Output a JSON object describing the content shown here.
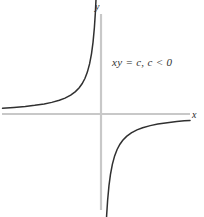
{
  "figure": {
    "title": "",
    "background_color": "#ffffff",
    "width": 204,
    "height": 217
  },
  "axes": {
    "x_label": "x",
    "y_label": "y",
    "axis_color": "#c8c8c8",
    "x_axis": {
      "y_pixel": 114,
      "x_start": 2,
      "x_end": 190
    },
    "y_axis": {
      "x_pixel": 101,
      "y_start": 14,
      "y_end": 210
    },
    "origin": {
      "x": 101,
      "y": 114
    }
  },
  "annotation": {
    "text": "xy = c,  c < 0",
    "color": "#303030"
  },
  "chart_data": {
    "type": "line",
    "title": "",
    "xlabel": "x",
    "ylabel": "y",
    "equation": "xy = c, c < 0",
    "curve_color": "#303030",
    "grid": false,
    "legend": "none",
    "xlim": [
      -5.2,
      4.7
    ],
    "ylim": [
      -5.2,
      2.65
    ],
    "annotations": [
      {
        "text": "xy = c,  c < 0",
        "x": 0.35,
        "y": 1.3
      }
    ],
    "series": [
      {
        "name": "upper-left branch",
        "quadrant": "II",
        "x": [
          -5.2,
          -4.6,
          -4.0,
          -3.5,
          -3.0,
          -2.6,
          -2.2,
          -1.9,
          -1.6,
          -1.35,
          -1.15,
          -1.0,
          -0.85,
          -0.72,
          -0.6,
          -0.5,
          -0.42,
          -0.35,
          -0.3,
          -0.26,
          -0.22,
          -0.19,
          -0.17
        ],
        "y": [
          0.154,
          0.174,
          0.2,
          0.229,
          0.267,
          0.308,
          0.364,
          0.421,
          0.5,
          0.593,
          0.696,
          0.8,
          0.941,
          1.111,
          1.333,
          1.6,
          1.905,
          2.286,
          2.667,
          3.077,
          3.636,
          4.211,
          4.706
        ]
      },
      {
        "name": "lower-right branch",
        "quadrant": "IV",
        "x": [
          0.17,
          0.19,
          0.22,
          0.26,
          0.3,
          0.35,
          0.42,
          0.5,
          0.6,
          0.72,
          0.85,
          1.0,
          1.15,
          1.35,
          1.6,
          1.9,
          2.2,
          2.6,
          3.0,
          3.5,
          4.0,
          4.4,
          4.7
        ],
        "y": [
          -4.706,
          -4.211,
          -3.636,
          -3.077,
          -2.667,
          -2.286,
          -1.905,
          -1.6,
          -1.333,
          -1.111,
          -0.941,
          -0.8,
          -0.696,
          -0.593,
          -0.5,
          -0.421,
          -0.364,
          -0.308,
          -0.267,
          -0.229,
          -0.2,
          -0.182,
          -0.17
        ]
      }
    ]
  }
}
